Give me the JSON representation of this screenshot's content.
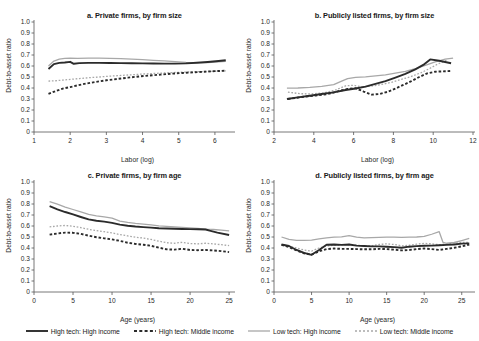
{
  "figure": {
    "clipped_header": "",
    "background": "#ffffff"
  },
  "axis_labels": {
    "y": "Debt-to-asset ratio",
    "x_size": "Labor (log)",
    "x_age": "Age (years)"
  },
  "legend": {
    "items": [
      {
        "label": "High tech: High income",
        "color": "#2b2b2b",
        "style": "solid",
        "width": 1.9
      },
      {
        "label": "High tech: Middle income",
        "color": "#2b2b2b",
        "style": "dashed",
        "width": 1.9
      },
      {
        "label": "Low tech: High income",
        "color": "#a8a8a8",
        "style": "solid",
        "width": 1.3
      },
      {
        "label": "Low tech: Middle income",
        "color": "#a8a8a8",
        "style": "dashed",
        "width": 1.3
      }
    ]
  },
  "chart_data": [
    {
      "id": "a",
      "type": "line",
      "title": "a. Private firms, by firm size",
      "xlabel": "Labor (log)",
      "ylabel": "Debt-to-asset ratio",
      "xlim": [
        1,
        6.5
      ],
      "ylim": [
        0,
        1.0
      ],
      "xticks": [
        1,
        2,
        3,
        4,
        5,
        6
      ],
      "yticks": [
        "0",
        "0.1",
        "0.2",
        "0.3",
        "0.4",
        "0.5",
        "0.6",
        "0.7",
        "0.8",
        "0.9",
        "1.0"
      ],
      "grid": false,
      "legend_position": "below-figure",
      "series": [
        {
          "name": "High tech: High income",
          "x": [
            1.4,
            1.55,
            1.7,
            1.85,
            2.0,
            2.1,
            2.25,
            2.5,
            2.8,
            3.1,
            3.4,
            3.7,
            4.0,
            4.3,
            4.6,
            4.9,
            5.2,
            5.5,
            5.8,
            6.1,
            6.3
          ],
          "y": [
            0.573,
            0.617,
            0.628,
            0.632,
            0.638,
            0.62,
            0.626,
            0.628,
            0.628,
            0.627,
            0.626,
            0.625,
            0.624,
            0.623,
            0.622,
            0.622,
            0.624,
            0.629,
            0.636,
            0.645,
            0.652
          ]
        },
        {
          "name": "High tech: Middle income",
          "x": [
            1.4,
            1.6,
            1.8,
            2.0,
            2.2,
            2.45,
            2.7,
            3.0,
            3.3,
            3.6,
            3.9,
            4.2,
            4.5,
            4.8,
            5.1,
            5.4,
            5.7,
            6.0,
            6.3
          ],
          "y": [
            0.347,
            0.372,
            0.395,
            0.408,
            0.424,
            0.441,
            0.455,
            0.47,
            0.482,
            0.494,
            0.505,
            0.514,
            0.522,
            0.53,
            0.537,
            0.542,
            0.548,
            0.553,
            0.557
          ]
        },
        {
          "name": "Low tech: High income",
          "x": [
            1.4,
            1.55,
            1.7,
            1.85,
            2.0,
            2.2,
            2.5,
            2.8,
            3.1,
            3.4,
            3.7,
            4.0,
            4.3,
            4.6,
            4.9,
            5.2,
            5.5,
            5.8,
            6.1,
            6.3
          ],
          "y": [
            0.6,
            0.645,
            0.662,
            0.67,
            0.672,
            0.67,
            0.672,
            0.672,
            0.67,
            0.667,
            0.663,
            0.658,
            0.652,
            0.646,
            0.64,
            0.633,
            0.63,
            0.632,
            0.637,
            0.642
          ]
        },
        {
          "name": "Low tech: Middle income",
          "x": [
            1.4,
            1.6,
            1.8,
            2.0,
            2.25,
            2.5,
            2.8,
            3.1,
            3.4,
            3.7,
            4.0,
            4.3,
            4.6,
            4.9,
            5.2,
            5.5,
            5.8,
            6.1,
            6.3
          ],
          "y": [
            0.463,
            0.466,
            0.472,
            0.478,
            0.486,
            0.493,
            0.5,
            0.508,
            0.514,
            0.52,
            0.527,
            0.532,
            0.537,
            0.541,
            0.545,
            0.548,
            0.551,
            0.554,
            0.556
          ]
        }
      ]
    },
    {
      "id": "b",
      "type": "line",
      "title": "b. Publicly listed firms, by firm size",
      "xlabel": "Labor (log)",
      "ylabel": "Debt-to-asset ratio",
      "xlim": [
        2,
        12
      ],
      "ylim": [
        0,
        1.0
      ],
      "xticks": [
        2,
        4,
        6,
        8,
        10,
        12
      ],
      "yticks": [
        "0",
        "0.1",
        "0.2",
        "0.3",
        "0.4",
        "0.5",
        "0.6",
        "0.7",
        "0.8",
        "0.9",
        "1.0"
      ],
      "grid": false,
      "legend_position": "below-figure",
      "series": [
        {
          "name": "High tech: High income",
          "x": [
            2.65,
            3.2,
            3.8,
            4.4,
            5.0,
            5.6,
            6.1,
            6.6,
            7.1,
            7.6,
            8.1,
            8.6,
            9.1,
            9.5,
            9.85,
            10.3,
            10.9
          ],
          "y": [
            0.3,
            0.315,
            0.33,
            0.345,
            0.36,
            0.382,
            0.395,
            0.412,
            0.437,
            0.463,
            0.495,
            0.528,
            0.57,
            0.61,
            0.66,
            0.648,
            0.625
          ]
        },
        {
          "name": "High tech: Middle income",
          "x": [
            2.7,
            3.4,
            4.1,
            4.7,
            5.2,
            5.7,
            6.1,
            6.5,
            6.9,
            7.3,
            7.7,
            8.1,
            8.5,
            8.9,
            9.3,
            9.7,
            10.1,
            10.6,
            10.9
          ],
          "y": [
            0.3,
            0.318,
            0.332,
            0.345,
            0.37,
            0.392,
            0.398,
            0.368,
            0.34,
            0.345,
            0.365,
            0.395,
            0.428,
            0.462,
            0.5,
            0.533,
            0.548,
            0.552,
            0.555
          ]
        },
        {
          "name": "Low tech: High income",
          "x": [
            2.65,
            3.2,
            3.8,
            4.4,
            5.0,
            5.4,
            5.7,
            6.1,
            6.6,
            7.1,
            7.6,
            8.1,
            8.6,
            9.1,
            9.6,
            10.1,
            10.6,
            11.0
          ],
          "y": [
            0.398,
            0.4,
            0.405,
            0.415,
            0.43,
            0.462,
            0.485,
            0.497,
            0.502,
            0.51,
            0.52,
            0.535,
            0.552,
            0.575,
            0.605,
            0.638,
            0.662,
            0.672
          ]
        },
        {
          "name": "Low tech: Middle income",
          "x": [
            2.7,
            3.3,
            3.9,
            4.5,
            5.1,
            5.6,
            6.0,
            6.4,
            6.9,
            7.4,
            7.9,
            8.4,
            8.9,
            9.4,
            9.8,
            10.2,
            10.7
          ],
          "y": [
            0.363,
            0.348,
            0.347,
            0.355,
            0.382,
            0.42,
            0.425,
            0.41,
            0.418,
            0.432,
            0.452,
            0.478,
            0.505,
            0.54,
            0.575,
            0.615,
            0.655
          ]
        }
      ]
    },
    {
      "id": "c",
      "type": "line",
      "title": "c. Private firms, by firm age",
      "xlabel": "Age (years)",
      "ylabel": "Debt-to-asset ratio",
      "xlim": [
        0,
        25.5
      ],
      "ylim": [
        0,
        1.0
      ],
      "xticks": [
        0,
        5,
        10,
        15,
        20,
        25
      ],
      "yticks": [
        "0",
        "0.1",
        "0.2",
        "0.3",
        "0.4",
        "0.5",
        "0.6",
        "0.7",
        "0.8",
        "0.9",
        "1.0"
      ],
      "grid": false,
      "legend_position": "below-figure",
      "series": [
        {
          "name": "High tech: High income",
          "x": [
            2.0,
            3.0,
            4.0,
            5.0,
            6.0,
            7.0,
            8.0,
            9.0,
            10.0,
            11.0,
            12.0,
            13.0,
            14.0,
            15.0,
            16.0,
            17.0,
            18.0,
            19.0,
            20.0,
            21.0,
            22.0,
            22.5,
            23.5,
            25.0
          ],
          "y": [
            0.78,
            0.752,
            0.727,
            0.705,
            0.682,
            0.66,
            0.648,
            0.64,
            0.628,
            0.612,
            0.602,
            0.595,
            0.59,
            0.585,
            0.58,
            0.577,
            0.575,
            0.573,
            0.572,
            0.57,
            0.568,
            0.558,
            0.54,
            0.518
          ]
        },
        {
          "name": "High tech: Middle income",
          "x": [
            2.0,
            3.0,
            4.0,
            5.0,
            6.0,
            7.0,
            8.0,
            9.0,
            10.0,
            11.0,
            12.0,
            13.0,
            14.0,
            15.0,
            16.0,
            17.0,
            18.0,
            19.0,
            20.0,
            21.0,
            22.0,
            23.0,
            24.0,
            25.0
          ],
          "y": [
            0.522,
            0.532,
            0.54,
            0.538,
            0.528,
            0.512,
            0.498,
            0.488,
            0.478,
            0.465,
            0.448,
            0.437,
            0.43,
            0.42,
            0.403,
            0.388,
            0.385,
            0.393,
            0.382,
            0.38,
            0.382,
            0.378,
            0.372,
            0.363
          ]
        },
        {
          "name": "Low tech: High income",
          "x": [
            2.0,
            3.0,
            4.0,
            5.0,
            6.0,
            7.0,
            8.0,
            9.0,
            10.0,
            11.0,
            12.0,
            13.0,
            14.0,
            15.0,
            16.0,
            17.0,
            18.0,
            19.0,
            20.0,
            21.0,
            22.0,
            23.0,
            24.0,
            25.0
          ],
          "y": [
            0.822,
            0.798,
            0.772,
            0.75,
            0.728,
            0.705,
            0.692,
            0.682,
            0.672,
            0.645,
            0.632,
            0.623,
            0.617,
            0.61,
            0.602,
            0.597,
            0.592,
            0.588,
            0.583,
            0.578,
            0.572,
            0.568,
            0.562,
            0.555
          ]
        },
        {
          "name": "Low tech: Middle income",
          "x": [
            2.0,
            3.0,
            4.0,
            5.0,
            6.0,
            7.0,
            8.0,
            9.0,
            10.0,
            11.0,
            12.0,
            13.0,
            14.0,
            15.0,
            16.0,
            17.0,
            18.0,
            19.0,
            20.0,
            21.0,
            22.0,
            23.0,
            24.0,
            25.0
          ],
          "y": [
            0.592,
            0.6,
            0.605,
            0.598,
            0.585,
            0.57,
            0.558,
            0.548,
            0.538,
            0.522,
            0.51,
            0.498,
            0.49,
            0.478,
            0.462,
            0.448,
            0.443,
            0.452,
            0.44,
            0.438,
            0.443,
            0.437,
            0.43,
            0.422
          ]
        }
      ]
    },
    {
      "id": "d",
      "type": "line",
      "title": "d. Publicly listed firms, by firm age",
      "xlabel": "Age (years)",
      "ylabel": "Debt-to-asset ratio",
      "xlim": [
        0,
        26.5
      ],
      "ylim": [
        0,
        1.0
      ],
      "xticks": [
        0,
        5,
        10,
        15,
        20,
        25
      ],
      "yticks": [
        "0",
        "0.1",
        "0.2",
        "0.3",
        "0.4",
        "0.5",
        "0.6",
        "0.7",
        "0.8",
        "0.9",
        "1.0"
      ],
      "grid": false,
      "legend_position": "below-figure",
      "series": [
        {
          "name": "High tech: High income",
          "x": [
            1.0,
            2.0,
            3.0,
            4.0,
            5.0,
            6.0,
            7.0,
            8.0,
            9.0,
            10.0,
            11.0,
            12.0,
            13.0,
            14.0,
            15.0,
            16.0,
            17.0,
            18.0,
            19.0,
            20.0,
            21.0,
            22.0,
            23.0,
            24.0,
            25.0,
            26.0
          ],
          "y": [
            0.432,
            0.418,
            0.382,
            0.355,
            0.338,
            0.382,
            0.43,
            0.432,
            0.428,
            0.432,
            0.422,
            0.418,
            0.415,
            0.415,
            0.412,
            0.408,
            0.402,
            0.412,
            0.417,
            0.42,
            0.422,
            0.425,
            0.428,
            0.432,
            0.44,
            0.442
          ]
        },
        {
          "name": "High tech: Middle income",
          "x": [
            1.0,
            2.0,
            3.0,
            4.0,
            5.0,
            6.0,
            7.0,
            8.0,
            9.0,
            10.0,
            11.0,
            12.0,
            13.0,
            14.0,
            15.0,
            16.0,
            17.0,
            18.0,
            19.0,
            20.0,
            21.0,
            22.0,
            23.0,
            24.0,
            25.0,
            26.0
          ],
          "y": [
            0.428,
            0.408,
            0.378,
            0.352,
            0.34,
            0.37,
            0.39,
            0.395,
            0.392,
            0.392,
            0.39,
            0.388,
            0.388,
            0.392,
            0.39,
            0.385,
            0.378,
            0.382,
            0.39,
            0.395,
            0.39,
            0.382,
            0.392,
            0.402,
            0.415,
            0.432
          ]
        },
        {
          "name": "Low tech: High income",
          "x": [
            1.0,
            2.0,
            3.0,
            4.0,
            5.0,
            6.0,
            7.0,
            8.0,
            9.0,
            10.0,
            11.0,
            12.0,
            13.0,
            14.0,
            15.0,
            16.0,
            17.0,
            18.0,
            19.0,
            20.0,
            21.0,
            22.0,
            22.5,
            23.0,
            24.0,
            25.0,
            26.0
          ],
          "y": [
            0.5,
            0.478,
            0.47,
            0.47,
            0.472,
            0.482,
            0.492,
            0.498,
            0.502,
            0.513,
            0.498,
            0.492,
            0.495,
            0.497,
            0.498,
            0.498,
            0.497,
            0.498,
            0.5,
            0.505,
            0.525,
            0.548,
            0.452,
            0.443,
            0.45,
            0.468,
            0.487
          ]
        },
        {
          "name": "Low tech: Middle income",
          "x": [
            1.0,
            2.0,
            3.0,
            4.0,
            5.0,
            6.0,
            7.0,
            8.0,
            9.0,
            10.0,
            11.0,
            12.0,
            13.0,
            14.0,
            15.0,
            16.0,
            17.0,
            18.0,
            19.0,
            20.0,
            21.0,
            22.0,
            23.0,
            24.0,
            25.0,
            26.0
          ],
          "y": [
            0.43,
            0.415,
            0.4,
            0.382,
            0.372,
            0.4,
            0.418,
            0.425,
            0.428,
            0.432,
            0.425,
            0.42,
            0.42,
            0.432,
            0.438,
            0.432,
            0.42,
            0.425,
            0.435,
            0.442,
            0.438,
            0.43,
            0.437,
            0.442,
            0.45,
            0.452
          ]
        }
      ]
    }
  ]
}
